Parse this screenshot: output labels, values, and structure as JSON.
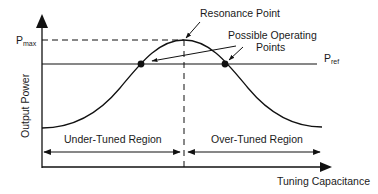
{
  "diagram": {
    "type": "tuning-curve",
    "labels": {
      "resonance_point": "Resonance Point",
      "possible_operating_line1": "Possible Operating",
      "possible_operating_line2": "Points",
      "pmax_main": "P",
      "pmax_sub": "max",
      "pref_main": "P",
      "pref_sub": "ref",
      "y_axis": "Output Power",
      "x_axis": "Tuning Capacitance",
      "under_tuned": "Under-Tuned Region",
      "over_tuned": "Over-Tuned Region"
    },
    "colors": {
      "stroke": "#111111",
      "background": "#ffffff"
    }
  }
}
